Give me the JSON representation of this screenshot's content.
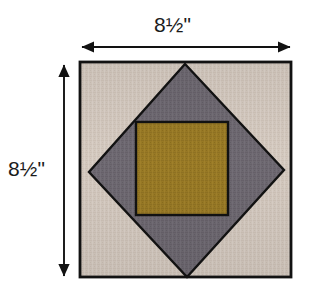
{
  "figure": {
    "kind": "quilt-block-diagram",
    "background_color": "#ffffff"
  },
  "dimensions": {
    "top": {
      "label": "8½\"",
      "value": "8.5",
      "unit": "inches",
      "orientation": "horizontal",
      "arrow_style": "double-headed"
    },
    "left": {
      "label": "8½\"",
      "value": "8.5",
      "unit": "inches",
      "orientation": "vertical",
      "arrow_style": "double-headed"
    }
  },
  "block": {
    "outline_color": "#121212",
    "outline_width": "2.6",
    "pieces": [
      {
        "id": "background-corners",
        "name": "corner-triangles",
        "fabric": "light taupe",
        "color": "#d6cbc1",
        "shade_dark": "#c2b6aa",
        "count": 4
      },
      {
        "id": "diamond",
        "name": "center-diamond",
        "fabric": "medium gray",
        "color": "#6f6a72",
        "shade_dark": "#5e5a63",
        "count": 1
      },
      {
        "id": "center-square",
        "name": "center-square",
        "fabric": "golden ochre",
        "color": "#9a7b26",
        "shade_dark": "#8a6d1e",
        "count": 1
      }
    ]
  },
  "geometry": {
    "outer_square": {
      "x1": 80,
      "y1": 62,
      "x2": 291,
      "y2": 277
    },
    "diamond_vertices": [
      {
        "x": 185,
        "y": 64
      },
      {
        "x": 284,
        "y": 170
      },
      {
        "x": 187,
        "y": 277
      },
      {
        "x": 89,
        "y": 172
      }
    ],
    "center_square": {
      "x1": 136,
      "y1": 122,
      "x2": 228,
      "y2": 215
    },
    "top_dim_line": {
      "x1": 80,
      "x2": 292,
      "y": 47
    },
    "left_dim_line": {
      "x": 64,
      "y1": 63,
      "y2": 278
    }
  }
}
